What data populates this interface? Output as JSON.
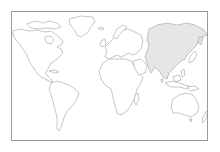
{
  "map": {
    "type": "world-outline",
    "projection": "equirectangular",
    "highlighted_region": "Asia",
    "colors": {
      "background": "#ffffff",
      "land_fill": "#ffffff",
      "highlight_fill": "#e6e6e6",
      "outline": "#8c8c8c",
      "frame": "#9a9a9a"
    },
    "regions": [
      {
        "name": "North America",
        "highlighted": false
      },
      {
        "name": "Greenland",
        "highlighted": false
      },
      {
        "name": "South America",
        "highlighted": false
      },
      {
        "name": "Europe",
        "highlighted": false
      },
      {
        "name": "Africa",
        "highlighted": false
      },
      {
        "name": "Madagascar",
        "highlighted": false
      },
      {
        "name": "Asia",
        "highlighted": true
      },
      {
        "name": "Japan",
        "highlighted": false
      },
      {
        "name": "Southeast Asia Islands",
        "highlighted": false
      },
      {
        "name": "Australia",
        "highlighted": false
      },
      {
        "name": "New Zealand",
        "highlighted": false
      }
    ]
  }
}
